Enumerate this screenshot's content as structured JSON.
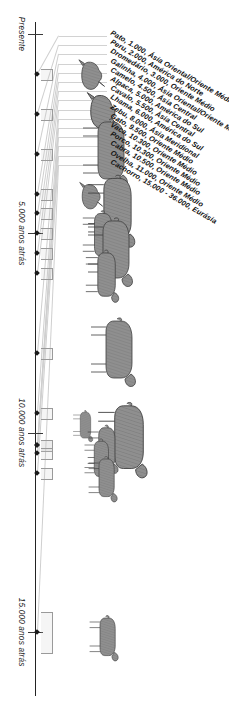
{
  "figure": {
    "title": "",
    "axis_labels": [
      "Presente",
      "5.000 anos atrás",
      "10.000 anos atrás",
      "15.000 anos atrás"
    ],
    "axis_label_present": "Presente",
    "axis_label_5k": "5.000 anos atrás",
    "axis_label_10k": "10.000 anos atrás",
    "axis_label_15k": "15.000 anos atrás",
    "colors": {
      "background": "#ffffff",
      "axis": "#232323",
      "leader": "#cfcfcf",
      "silhouette_fill": "#8f8f8f",
      "silhouette_stroke": "#3d3d3d",
      "text": "#111111"
    }
  },
  "chart_data": {
    "type": "scatter",
    "title": "",
    "xlabel": "",
    "ylabel": "",
    "xlim": [
      0,
      16000
    ],
    "grid": false,
    "legend": "none",
    "axis_ticks": [
      {
        "value": 0,
        "label": "Presente"
      },
      {
        "value": 5000,
        "label": "5.000 anos atrás"
      },
      {
        "value": 10000,
        "label": "10.000 anos atrás"
      },
      {
        "value": 15000,
        "label": "15.000 anos atrás"
      }
    ],
    "categories": [
      "Pato",
      "Peru",
      "Dromedário",
      "Galinha",
      "Camelo",
      "Alpaca",
      "Cavalo",
      "Lhama",
      "Zebu",
      "Gato",
      "Vaca",
      "Porco",
      "Cabra",
      "Ovelha",
      "Cachorro"
    ],
    "values": [
      1000,
      2000,
      3000,
      4000,
      4500,
      5000,
      5500,
      6000,
      8000,
      9500,
      10300,
      10300,
      10500,
      11000,
      15000
    ],
    "points": [
      {
        "species": "Pato",
        "years_ago": 1000,
        "years_text": "1.000",
        "region": "Ásia Oriental/Oriente Médio",
        "label": "Pato, 1.000, Ásia Oriental/Oriente Médio",
        "icon": "duck-icon"
      },
      {
        "species": "Peru",
        "years_ago": 2000,
        "years_text": "2.000",
        "region": "América do Norte",
        "label": "Peru, 2.000, América do Norte",
        "icon": "turkey-icon"
      },
      {
        "species": "Dromedário",
        "years_ago": 3000,
        "years_text": "3.000",
        "region": "Oriente Médio",
        "label": "Dromedário, 3.000, Oriente Médio",
        "icon": "dromedary-icon"
      },
      {
        "species": "Galinha",
        "years_ago": 4000,
        "years_text": "4.000",
        "region": "Ásia Oriental/Oriente Médio",
        "label": "Galinha, 4.000, Ásia Oriental/Oriente Médio",
        "icon": "chicken-icon"
      },
      {
        "species": "Camelo",
        "years_ago": 4500,
        "years_text": "4.500",
        "region": "Ásia Central",
        "label": "Camelo, 4.500, Ásia Central",
        "icon": "camel-icon"
      },
      {
        "species": "Alpaca",
        "years_ago": 5000,
        "years_text": "5.000",
        "region": "América do Sul",
        "label": "Alpaca, 5.000, América do Sul",
        "icon": "alpaca-icon"
      },
      {
        "species": "Cavalo",
        "years_ago": 5500,
        "years_text": "5.500",
        "region": "Ásia Central",
        "label": "Cavalo, 5.500, Ásia Central",
        "icon": "horse-icon"
      },
      {
        "species": "Lhama",
        "years_ago": 6000,
        "years_text": "6.000",
        "region": "América do Sul",
        "label": "Lhama, 6.000, América do Sul",
        "icon": "llama-icon"
      },
      {
        "species": "Zebu",
        "years_ago": 8000,
        "years_text": "8.000",
        "region": "Ásia Meridional",
        "label": "Zebu, 8.000, Ásia Meridional",
        "icon": "zebu-icon"
      },
      {
        "species": "Gato",
        "years_ago": 9500,
        "years_text": "9.500",
        "region": "Oriente Médio",
        "label": "Gato, 9.500, Oriente Médio",
        "icon": "cat-icon"
      },
      {
        "species": "Vaca",
        "years_ago": 10300,
        "years_text": "10.300",
        "region": "Oriente Médio",
        "label": "Vaca, 10.300, Oriente Médio",
        "icon": "cow-icon"
      },
      {
        "species": "Porco",
        "years_ago": 10300,
        "years_text": "10.300",
        "region": "Oriente Médio",
        "label": "Porco, 10.300, Oriente Médio",
        "icon": "pig-icon"
      },
      {
        "species": "Cabra",
        "years_ago": 10500,
        "years_text": "10.500",
        "region": "Oriente Médio",
        "label": "Cabra, 10.500, Oriente Médio",
        "icon": "goat-icon"
      },
      {
        "species": "Ovelha",
        "years_ago": 11000,
        "years_text": "11.000",
        "region": "Oriente Médio",
        "label": "Ovelha, 11.000, Oriente Médio",
        "icon": "sheep-icon"
      },
      {
        "species": "Cachorro",
        "years_ago": 15000,
        "years_text": "15.000 - 36.000",
        "region": "Eurásia",
        "label": "Cachorro, 15.000 - 36.000, Eurásia",
        "icon": "dog-icon"
      }
    ]
  }
}
